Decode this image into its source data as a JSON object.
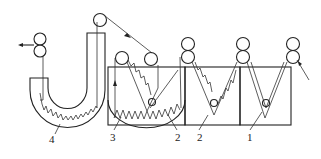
{
  "diagram": {
    "type": "textile wet-processing machine schematic",
    "labels": [
      {
        "id": "label-1",
        "text": "1",
        "x": 248,
        "y": 140
      },
      {
        "id": "label-2a",
        "text": "2",
        "x": 175,
        "y": 140
      },
      {
        "id": "label-2b",
        "text": "2",
        "x": 199,
        "y": 140
      },
      {
        "id": "label-3",
        "text": "3",
        "x": 112,
        "y": 140
      },
      {
        "id": "label-4",
        "text": "4",
        "x": 49,
        "y": 143
      }
    ],
    "components": [
      {
        "name": "tank-1",
        "label": "1"
      },
      {
        "name": "tank-2",
        "label": "2"
      },
      {
        "name": "tank-3",
        "label": "3"
      },
      {
        "name": "u-tube-steamer",
        "label": "4"
      }
    ],
    "flow": {
      "entry": "right",
      "exit": "left"
    },
    "colors": {
      "line": "#222222",
      "background": "#ffffff"
    }
  }
}
